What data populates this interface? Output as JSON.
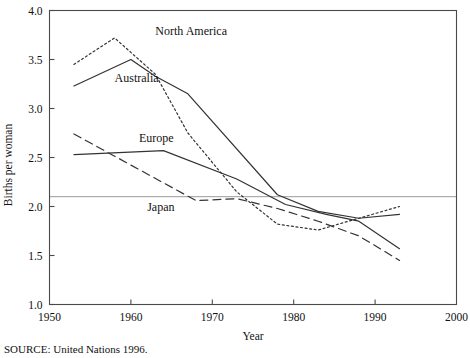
{
  "chart_data": {
    "type": "line",
    "title": "",
    "xlabel": "Year",
    "ylabel": "Births per woman",
    "xlim": [
      1950,
      2000
    ],
    "ylim": [
      1.0,
      4.0
    ],
    "xticks": [
      "1950",
      "1960",
      "1970",
      "1980",
      "1990",
      "2000"
    ],
    "xtick_values": [
      1950,
      1960,
      1970,
      1980,
      1990,
      2000
    ],
    "yticks": [
      "1.0",
      "1.5",
      "2.0",
      "2.5",
      "3.0",
      "3.5",
      "4.0"
    ],
    "ytick_values": [
      1.0,
      1.5,
      2.0,
      2.5,
      3.0,
      3.5,
      4.0
    ],
    "grid": false,
    "legend_position": "inline-labels",
    "reference_line": {
      "label": "replacement-level fertility",
      "value": 2.1,
      "orientation": "horizontal",
      "color": "#9a9a9a"
    },
    "series": [
      {
        "name": "North America",
        "style": "dotted",
        "color": "#333333",
        "x": [
          1953,
          1958,
          1963,
          1967,
          1973,
          1978,
          1983,
          1988,
          1993
        ],
        "values": [
          3.45,
          3.72,
          3.35,
          2.75,
          2.15,
          1.82,
          1.76,
          1.88,
          2.0
        ]
      },
      {
        "name": "Australia",
        "style": "solid",
        "color": "#333333",
        "x": [
          1953,
          1960,
          1963,
          1967,
          1978,
          1983,
          1988,
          1993
        ],
        "values": [
          3.23,
          3.5,
          3.33,
          3.15,
          2.12,
          1.95,
          1.88,
          1.92
        ]
      },
      {
        "name": "Europe",
        "style": "solid",
        "color": "#333333",
        "x": [
          1953,
          1964,
          1973,
          1979,
          1984,
          1988,
          1993
        ],
        "values": [
          2.53,
          2.57,
          2.28,
          2.02,
          1.92,
          1.85,
          1.57
        ]
      },
      {
        "name": "Japan",
        "style": "dashed",
        "color": "#333333",
        "x": [
          1953,
          1968,
          1973,
          1978,
          1983,
          1988,
          1993
        ],
        "values": [
          2.74,
          2.06,
          2.08,
          1.98,
          1.85,
          1.7,
          1.45
        ]
      }
    ],
    "series_labels": [
      {
        "text": "North America",
        "x": 1963,
        "y": 3.75
      },
      {
        "text": "Australia",
        "x": 1958,
        "y": 3.27
      },
      {
        "text": "Europe",
        "x": 1961,
        "y": 2.66
      },
      {
        "text": "Japan",
        "x": 1962,
        "y": 1.95
      }
    ],
    "source": "SOURCE: United Nations 1996."
  }
}
